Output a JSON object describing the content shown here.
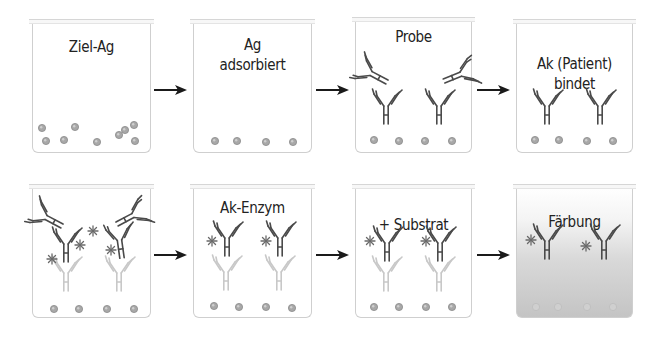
{
  "figure": {
    "colors": {
      "border": "#cfcfcf",
      "text": "#222222",
      "antibody_dark": "#4a4a4a",
      "antibody_faded": "#c8c8c8",
      "antigen_fill": "#a8a8a8",
      "antigen_stroke": "#8a8a8a",
      "enzyme": "#6a6a6a",
      "arrow": "#1a1a1a",
      "stain": "#c4c4c4"
    }
  },
  "rows": [
    {
      "steps": [
        {
          "id": "step-1",
          "label": "Ziel-Ag",
          "label_top": 37,
          "stained": false,
          "box": {
            "x": 32,
            "y": 22,
            "w": 119,
            "h": 131
          },
          "antigens": [
            [
              42,
              128
            ],
            [
              75,
              127
            ],
            [
              125,
              130
            ],
            [
              134,
              125
            ],
            [
              46,
              141
            ],
            [
              64,
              140
            ],
            [
              97,
              142
            ],
            [
              119,
              135
            ],
            [
              135,
              141
            ]
          ],
          "antibodies": []
        },
        {
          "id": "step-2",
          "label": "Ag\nadsorbiert",
          "label_top": 35,
          "stained": false,
          "box": {
            "x": 193,
            "y": 22,
            "w": 119,
            "h": 131
          },
          "antigens": [
            [
              215,
              141
            ],
            [
              237,
              141
            ],
            [
              266,
              142
            ],
            [
              293,
              142
            ]
          ],
          "antibodies": []
        },
        {
          "id": "step-3",
          "label": "Probe",
          "label_top": 27,
          "stained": false,
          "box": {
            "x": 355,
            "y": 20,
            "w": 117,
            "h": 133
          },
          "antigens": [
            [
              374,
              140
            ],
            [
              399,
              141
            ],
            [
              425,
              141
            ],
            [
              452,
              141
            ]
          ],
          "antibodies": [
            {
              "x": 386,
              "y": 124,
              "rot": 0,
              "style": "dark"
            },
            {
              "x": 439,
              "y": 124,
              "rot": 0,
              "style": "dark"
            },
            {
              "x": 387,
              "y": 82,
              "rot": -62,
              "style": "dark"
            },
            {
              "x": 444,
              "y": 81,
              "rot": 68,
              "style": "dark"
            }
          ],
          "enzymes": []
        },
        {
          "id": "step-4",
          "label": "Ak (Patient)\nbindet",
          "label_top": 54,
          "stained": false,
          "box": {
            "x": 516,
            "y": 22,
            "w": 117,
            "h": 131
          },
          "antigens": [
            [
              535,
              140
            ],
            [
              559,
              140
            ],
            [
              587,
              141
            ],
            [
              613,
              141
            ]
          ],
          "antibodies": [
            {
              "x": 547,
              "y": 124,
              "rot": 0,
              "style": "dark"
            },
            {
              "x": 600,
              "y": 124,
              "rot": 0,
              "style": "dark"
            }
          ]
        }
      ],
      "arrows": [
        {
          "x1": 154,
          "x2": 187,
          "y": 90
        },
        {
          "x1": 316,
          "x2": 349,
          "y": 90
        },
        {
          "x1": 477,
          "x2": 510,
          "y": 90
        }
      ]
    },
    {
      "steps": [
        {
          "id": "step-5",
          "label": "",
          "label_top": 0,
          "stained": false,
          "box": {
            "x": 32,
            "y": 187,
            "w": 119,
            "h": 131
          },
          "antigens": [
            [
              54,
              309
            ],
            [
              79,
              309
            ],
            [
              107,
              309
            ],
            [
              134,
              309
            ]
          ],
          "antibodies": [
            {
              "x": 66,
              "y": 291,
              "rot": 0,
              "style": "faded"
            },
            {
              "x": 119,
              "y": 291,
              "rot": 0,
              "style": "faded"
            },
            {
              "x": 66,
              "y": 262,
              "rot": 0,
              "style": "dark"
            },
            {
              "x": 122,
              "y": 258,
              "rot": -8,
              "style": "dark"
            },
            {
              "x": 62,
              "y": 226,
              "rot": -62,
              "style": "dark"
            },
            {
              "x": 117,
              "y": 224,
              "rot": 62,
              "style": "dark"
            }
          ],
          "enzymes": [
            [
              93,
              231
            ],
            [
              80,
              245
            ],
            [
              52,
              259
            ],
            [
              111,
              250
            ]
          ]
        },
        {
          "id": "step-6",
          "label": "Ak-Enzym",
          "label_top": 198,
          "stained": false,
          "box": {
            "x": 193,
            "y": 187,
            "w": 119,
            "h": 131
          },
          "antigens": [
            [
              214,
              306
            ],
            [
              239,
              307
            ],
            [
              266,
              307
            ],
            [
              292,
              308
            ]
          ],
          "antibodies": [
            {
              "x": 226,
              "y": 290,
              "rot": 0,
              "style": "faded"
            },
            {
              "x": 279,
              "y": 290,
              "rot": 0,
              "style": "faded"
            },
            {
              "x": 227,
              "y": 256,
              "rot": 0,
              "style": "dark"
            },
            {
              "x": 280,
              "y": 256,
              "rot": 0,
              "style": "dark"
            }
          ],
          "enzymes": [
            [
              212,
              241
            ],
            [
              266,
              241
            ]
          ]
        },
        {
          "id": "step-7",
          "label": "+ Substrat",
          "label_top": 215,
          "stained": false,
          "box": {
            "x": 355,
            "y": 187,
            "w": 117,
            "h": 131
          },
          "antigens": [
            [
              374,
              307
            ],
            [
              399,
              307
            ],
            [
              426,
              307
            ],
            [
              452,
              307
            ]
          ],
          "antibodies": [
            {
              "x": 386,
              "y": 291,
              "rot": 0,
              "style": "faded"
            },
            {
              "x": 439,
              "y": 291,
              "rot": 0,
              "style": "faded"
            },
            {
              "x": 387,
              "y": 261,
              "rot": 0,
              "style": "dark"
            },
            {
              "x": 440,
              "y": 261,
              "rot": 0,
              "style": "dark"
            }
          ],
          "enzymes": [
            [
              370,
              241
            ],
            [
              426,
              241
            ]
          ]
        },
        {
          "id": "step-8",
          "label": "Färbung",
          "label_top": 212,
          "stained": true,
          "box": {
            "x": 516,
            "y": 187,
            "w": 117,
            "h": 131
          },
          "antigens": [
            [
              536,
              307
            ],
            [
              558,
              307
            ],
            [
              587,
              307
            ],
            [
              613,
              307
            ]
          ],
          "antibodies": [
            {
              "x": 547,
              "y": 259,
              "rot": 0,
              "style": "dark"
            },
            {
              "x": 604,
              "y": 259,
              "rot": 0,
              "style": "dark"
            }
          ],
          "enzymes": [
            [
              531,
              240
            ],
            [
              586,
              246
            ]
          ]
        }
      ],
      "arrows": [
        {
          "x1": 154,
          "x2": 187,
          "y": 255
        },
        {
          "x1": 316,
          "x2": 349,
          "y": 255
        },
        {
          "x1": 477,
          "x2": 510,
          "y": 255
        }
      ]
    }
  ]
}
